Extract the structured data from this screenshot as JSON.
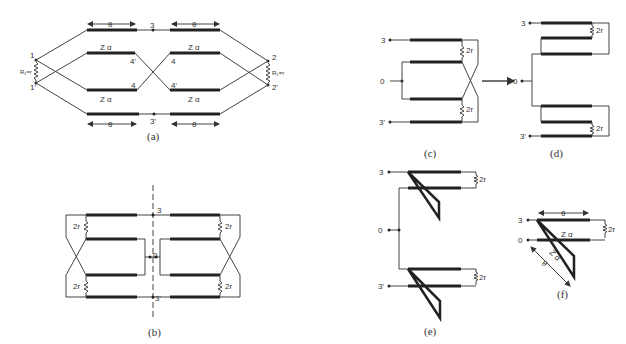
{
  "figure": {
    "panels": [
      {
        "id": "a",
        "caption": "(a)",
        "labels": {
          "theta": "θ",
          "node3": "3",
          "node3p": "3'",
          "node1": "1",
          "node1p": "1'",
          "node2": "2",
          "node2p": "2'",
          "node4": "4",
          "node4p": "4'",
          "z": "Z α",
          "r1": "R₁=r",
          "r2": "R₂=r"
        }
      },
      {
        "id": "b",
        "caption": "(b)",
        "labels": {
          "node3": "3",
          "node3p": "3'",
          "node0": "0",
          "res": "2r"
        }
      },
      {
        "id": "c",
        "caption": "(c)",
        "labels": {
          "node3": "3",
          "node3p": "3'",
          "node0": "0",
          "res": "2r"
        }
      },
      {
        "id": "d",
        "caption": "(d)",
        "labels": {
          "node3": "3",
          "node3p": "3'",
          "node0": "0",
          "res": "2r"
        }
      },
      {
        "id": "e",
        "caption": "(e)",
        "labels": {
          "node3": "3",
          "node3p": "3'",
          "node0": "0",
          "res": "2r"
        }
      },
      {
        "id": "f",
        "caption": "(f)",
        "labels": {
          "node3": "3",
          "node0": "0",
          "theta": "θ",
          "z": "Z α",
          "res": "2r"
        }
      }
    ]
  }
}
